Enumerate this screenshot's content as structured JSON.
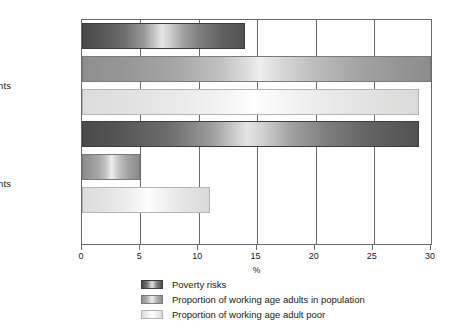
{
  "chart_data": {
    "type": "bar",
    "orientation": "horizontal",
    "title": "",
    "xlabel": "%",
    "ylabel": "",
    "xlim": [
      0,
      30
    ],
    "xticks": [
      0,
      5,
      10,
      15,
      20,
      25,
      30
    ],
    "xticklabels": [
      "0",
      "5",
      "10",
      "15",
      "20",
      "25",
      "30"
    ],
    "grid": "vertical",
    "legend_position": "bottom",
    "categories": [
      "Couple parents",
      "Lone parents"
    ],
    "series": [
      {
        "name": "Poverty risks",
        "color": "#4a4a4a",
        "values": [
          14,
          29
        ]
      },
      {
        "name": "Proportion of working age adults in population",
        "color": "#8e8e8e",
        "values": [
          30,
          5
        ]
      },
      {
        "name": "Proportion of working age adult poor",
        "color": "#dcdcdc",
        "values": [
          29,
          11
        ]
      }
    ]
  },
  "axis": {
    "x_title": "%",
    "tick_labels": [
      "0",
      "5",
      "10",
      "15",
      "20",
      "25",
      "30"
    ]
  },
  "categories": [
    {
      "label": "Couple parents"
    },
    {
      "label": "Lone parents"
    }
  ],
  "legend": {
    "items": [
      {
        "label": "Poverty risks"
      },
      {
        "label": "Proportion of working age adults in population"
      },
      {
        "label": "Proportion of working age adult poor"
      }
    ]
  }
}
